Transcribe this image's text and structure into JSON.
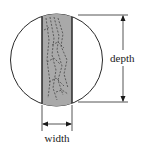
{
  "diagram": {
    "type": "cross-section of log with rectangular cut (beam) inscribed in circle",
    "labels": {
      "depth": "depth",
      "width": "width"
    },
    "colors": {
      "background": "#ffffff",
      "stroke": "#2a2a2a",
      "beam_fill": "#a9a9a9",
      "grain_dash": "#3a3a3a"
    },
    "shapes": {
      "circle": {
        "cx": 56.5,
        "cy": 60,
        "r": 46
      },
      "beam": {
        "x": 42,
        "y": 15,
        "width": 30,
        "height": 88
      },
      "depth_dimension": {
        "x": 123,
        "y1": 15,
        "y2": 102
      },
      "width_dimension": {
        "y": 124,
        "x1": 42,
        "x2": 72
      }
    }
  }
}
